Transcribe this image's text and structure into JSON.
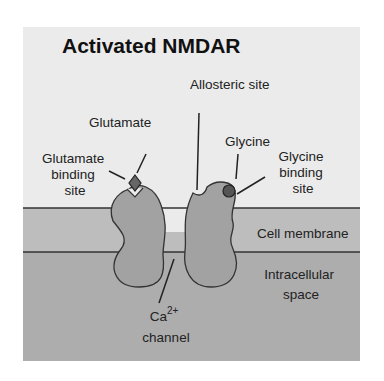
{
  "title": "Activated NMDAR",
  "labels": {
    "allosteric_site": "Allosteric site",
    "glutamate": "Glutamate",
    "glutamate_binding_site": [
      "Glutamate",
      "binding",
      "site"
    ],
    "glycine": "Glycine",
    "glycine_binding_site": [
      "Glycine",
      "binding",
      "site"
    ],
    "cell_membrane": "Cell membrane",
    "intracellular_space": [
      "Intracellular",
      "space"
    ],
    "ca_channel": {
      "ion": "Ca",
      "charge": "2+",
      "word": "channel"
    }
  },
  "colors": {
    "extracellular": "#ebebeb",
    "membrane": "#bdbdbd",
    "intracellular": "#adadad",
    "receptor": "#a2a2a2",
    "outline": "#333333",
    "glutamate": "#666666",
    "glycine": "#555555"
  }
}
